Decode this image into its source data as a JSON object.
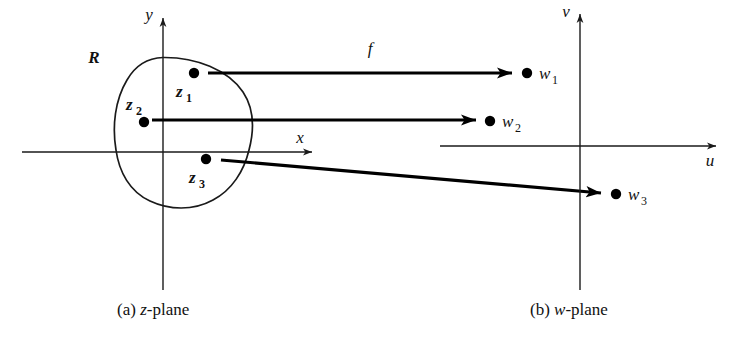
{
  "figure": {
    "z_plane": {
      "region_label": "R",
      "axes": {
        "x_label": "x",
        "y_label": "y"
      },
      "points": [
        {
          "id": "z1",
          "base": "z",
          "sub": "1",
          "x": 194,
          "y": 73
        },
        {
          "id": "z2",
          "base": "z",
          "sub": "2",
          "x": 144,
          "y": 122
        },
        {
          "id": "z3",
          "base": "z",
          "sub": "3",
          "x": 206,
          "y": 159
        }
      ],
      "caption": "(a) ",
      "caption_italic": "z",
      "caption_rest": "-plane"
    },
    "w_plane": {
      "axes": {
        "u_label": "u",
        "v_label": "v"
      },
      "points": [
        {
          "id": "w1",
          "base": "w",
          "sub": "1",
          "x": 527,
          "y": 73
        },
        {
          "id": "w2",
          "base": "w",
          "sub": "2",
          "x": 490,
          "y": 121
        },
        {
          "id": "w3",
          "base": "w",
          "sub": "3",
          "x": 616,
          "y": 194
        }
      ],
      "caption": "(b) ",
      "caption_italic": "w",
      "caption_rest": "-plane"
    },
    "mapping": {
      "function_label": "f",
      "arrows": [
        {
          "name": "arrow-z1-to-w1",
          "x1": 208,
          "y1": 73,
          "x2": 512,
          "y2": 73
        },
        {
          "name": "arrow-z2-to-w2",
          "x1": 152,
          "y1": 120,
          "x2": 476,
          "y2": 120
        },
        {
          "name": "arrow-z3-to-w3",
          "x1": 221,
          "y1": 160,
          "x2": 601,
          "y2": 193
        }
      ]
    },
    "colors": {
      "ink": "#111111",
      "background": "#ffffff"
    }
  }
}
